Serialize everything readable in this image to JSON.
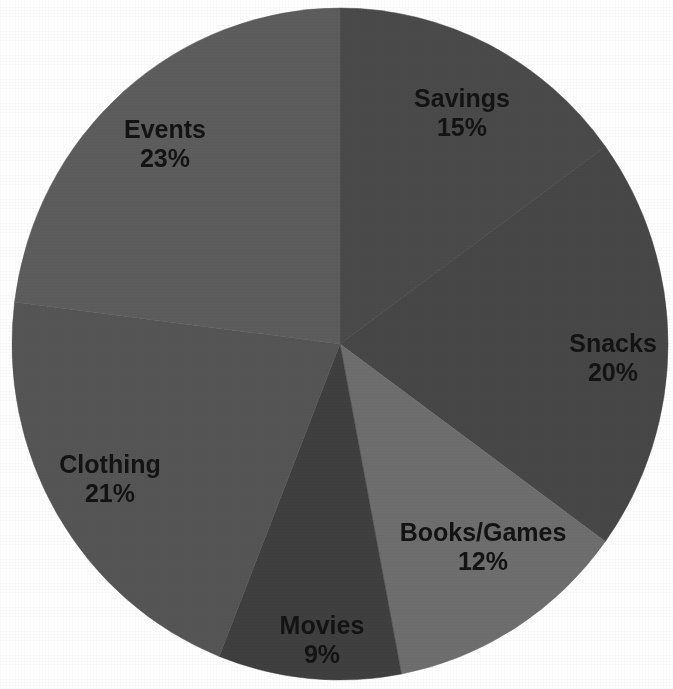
{
  "chart_data": {
    "type": "pie",
    "title": "",
    "subtitle": "",
    "xlabel": "",
    "ylabel": "",
    "legend_position": "none",
    "grid": false,
    "labels_inside_slices": true,
    "start_angle_deg": 0,
    "direction": "clockwise",
    "total": 100,
    "unit": "%",
    "categories": [
      "Savings",
      "Snacks",
      "Books/Games",
      "Movies",
      "Clothing",
      "Events"
    ],
    "values": [
      15,
      20,
      12,
      9,
      21,
      23
    ],
    "slices": [
      {
        "label": "Savings",
        "value": 15,
        "value_text": "15%",
        "color": "#4a4a4a",
        "label_x": 462,
        "label_y": 100,
        "value_x": 462,
        "value_y": 129
      },
      {
        "label": "Snacks",
        "value": 20,
        "value_text": "20%",
        "color": "#474747",
        "label_x": 613,
        "label_y": 345,
        "value_x": 613,
        "value_y": 374
      },
      {
        "label": "Books/Games",
        "value": 12,
        "value_text": "12%",
        "color": "#6e6e6e",
        "label_x": 483,
        "label_y": 534,
        "value_x": 483,
        "value_y": 563
      },
      {
        "label": "Movies",
        "value": 9,
        "value_text": "9%",
        "color": "#3f3f3f",
        "label_x": 322,
        "label_y": 627,
        "value_x": 322,
        "value_y": 656
      },
      {
        "label": "Clothing",
        "value": 21,
        "value_text": "21%",
        "color": "#555555",
        "label_x": 110,
        "label_y": 466,
        "value_x": 110,
        "value_y": 495
      },
      {
        "label": "Events",
        "value": 23,
        "value_text": "23%",
        "color": "#5d5d5d",
        "label_x": 165,
        "label_y": 131,
        "value_x": 165,
        "value_y": 160
      }
    ],
    "geometry": {
      "center_x": 340,
      "center_y": 344,
      "radius_x": 328,
      "radius_y": 336
    },
    "background_color": "#ffffff",
    "label_color": "#131313"
  }
}
